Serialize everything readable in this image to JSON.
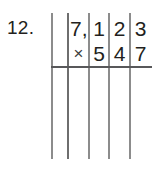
{
  "problem": {
    "number_label": "12.",
    "operation": "multiplication",
    "multiplicand": "7,123",
    "multiplier": "547",
    "top_row": [
      {
        "cell": "thousands",
        "text": "7,"
      },
      {
        "cell": "hundreds",
        "text": "1"
      },
      {
        "cell": "tens",
        "text": "2"
      },
      {
        "cell": "ones",
        "text": "3"
      }
    ],
    "bottom_row": [
      {
        "cell": "operator",
        "text": "×"
      },
      {
        "cell": "hundreds",
        "text": "5"
      },
      {
        "cell": "tens",
        "text": "4"
      },
      {
        "cell": "ones",
        "text": "7"
      }
    ],
    "answer_area": {
      "rows": "",
      "note": ""
    }
  },
  "colors": {
    "ink": "#231f20",
    "rule_light": "#8c8c8c",
    "rule_dark": "#58585a",
    "paper": "#ffffff"
  }
}
